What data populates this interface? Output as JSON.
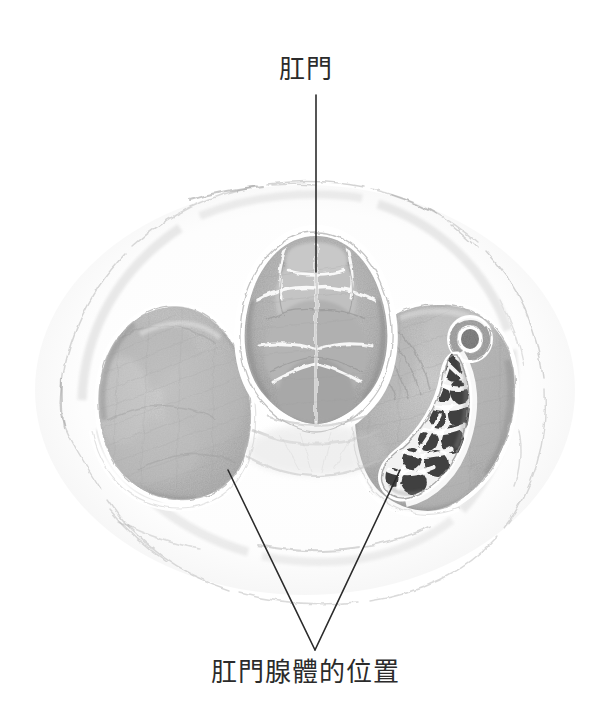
{
  "figure": {
    "title_top": "肛門",
    "title_bottom": "肛門腺體的位置",
    "background_color": "#ffffff",
    "ink_color": "#2b2b2b",
    "medium": "pencil-sketch-anatomical-cross-section",
    "labels": [
      {
        "name": "anus-label",
        "text": "肛門",
        "x": 317,
        "y": 70,
        "leader_line": {
          "from_x": 316,
          "from_y": 95,
          "to_x": 316,
          "to_y": 272
        }
      },
      {
        "name": "anal-glands-label",
        "text": "肛門腺體的位置",
        "x": 310,
        "y": 676,
        "leader_lines": [
          {
            "from_x": 315,
            "from_y": 650,
            "to_x": 228,
            "to_y": 470
          },
          {
            "from_x": 315,
            "from_y": 650,
            "to_x": 400,
            "to_y": 470
          }
        ]
      }
    ],
    "structures": [
      {
        "name": "body-outline",
        "description": "outer oval body contour",
        "fill": "#ffffff",
        "stroke": "#cfcfcf"
      },
      {
        "name": "anal-canal",
        "description": "central folded anal canal mucosa",
        "fill": "#bdbdbd"
      },
      {
        "name": "left-muscle-mass",
        "description": "left smooth gray muscle mass",
        "fill": "#c2c2c2"
      },
      {
        "name": "right-muscle-mass",
        "description": "right muscle mass containing gland",
        "fill": "#bcbcbc"
      },
      {
        "name": "anal-gland-lobules",
        "description": "dark polygonal gland lobules with white septa",
        "fill": "#4a4a4a"
      },
      {
        "name": "gland-duct",
        "description": "small ring-shaped duct above the gland",
        "fill": "#8f8f8f"
      }
    ]
  }
}
